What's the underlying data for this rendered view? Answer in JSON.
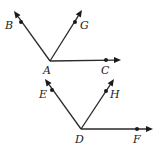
{
  "figures": [
    {
      "name": "angle-A",
      "vertex": {
        "label": "A",
        "x": 50,
        "y": 61,
        "lx": 43,
        "ly": 74
      },
      "rays": [
        {
          "label": "B",
          "tip": [
            14,
            11
          ],
          "dot": [
            21,
            22
          ],
          "lx": 5,
          "ly": 29
        },
        {
          "label": "G",
          "tip": [
            82,
            10
          ],
          "dot": [
            75,
            22
          ],
          "lx": 80,
          "ly": 29
        },
        {
          "label": "C",
          "tip": [
            121,
            60
          ],
          "dot": [
            106,
            60
          ],
          "lx": 101,
          "ly": 74
        }
      ]
    },
    {
      "name": "angle-D",
      "vertex": {
        "label": "D",
        "x": 81,
        "y": 129,
        "lx": 75,
        "ly": 143
      },
      "rays": [
        {
          "label": "E",
          "tip": [
            45,
            79
          ],
          "dot": [
            52,
            90
          ],
          "lx": 39,
          "ly": 98
        },
        {
          "label": "H",
          "tip": [
            114,
            79
          ],
          "dot": [
            106,
            91
          ],
          "lx": 110,
          "ly": 98
        },
        {
          "label": "F",
          "tip": [
            153,
            129
          ],
          "dot": [
            137,
            129
          ],
          "lx": 133,
          "ly": 143
        }
      ]
    }
  ],
  "colors": {
    "stroke": "#2a2a2a",
    "background": "#ffffff"
  }
}
